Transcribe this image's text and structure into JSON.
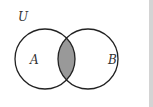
{
  "diagram": {
    "type": "venn",
    "universe_label": "U",
    "sets": [
      {
        "label": "A",
        "cx": 45,
        "cy": 59,
        "r": 30
      },
      {
        "label": "B",
        "cx": 88,
        "cy": 59,
        "r": 30
      }
    ],
    "shaded_region": "A ∩ B",
    "colors": {
      "stroke": "#222222",
      "shade": "#999999",
      "background": "#ffffff"
    }
  }
}
